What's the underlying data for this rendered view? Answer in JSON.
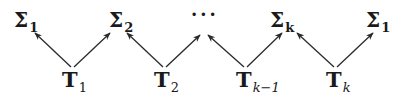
{
  "diagram": {
    "type": "zigzag-arrow-diagram",
    "top_nodes": [
      {
        "id": "sigma1_left",
        "symbol": "Σ",
        "subscript": "1",
        "x": 14,
        "y": 10
      },
      {
        "id": "sigma2",
        "symbol": "Σ",
        "subscript": "2",
        "x": 109,
        "y": 10
      },
      {
        "id": "ellipsis",
        "symbol": "···",
        "subscript": "",
        "x": 191,
        "y": 5
      },
      {
        "id": "sigmak",
        "symbol": "Σ",
        "subscript": "k",
        "x": 270,
        "y": 10
      },
      {
        "id": "sigma1_right",
        "symbol": "Σ",
        "subscript": "1",
        "x": 366,
        "y": 10
      }
    ],
    "bottom_nodes": [
      {
        "id": "T1",
        "symbol": "T",
        "subscript": "1",
        "x": 62,
        "y": 70
      },
      {
        "id": "T2",
        "symbol": "T",
        "subscript": "2",
        "x": 154,
        "y": 70
      },
      {
        "id": "Tk_minus_1",
        "symbol": "T",
        "subscript": "k−1",
        "x": 236,
        "y": 70
      },
      {
        "id": "Tk",
        "symbol": "T",
        "subscript": "k",
        "x": 326,
        "y": 70
      }
    ],
    "edges": [
      {
        "from": "T1",
        "to": "sigma1_left"
      },
      {
        "from": "T1",
        "to": "sigma2"
      },
      {
        "from": "T2",
        "to": "sigma2"
      },
      {
        "from": "T2",
        "to": "ellipsis"
      },
      {
        "from": "Tk_minus_1",
        "to": "ellipsis"
      },
      {
        "from": "Tk_minus_1",
        "to": "sigmak"
      },
      {
        "from": "Tk",
        "to": "sigmak"
      },
      {
        "from": "Tk",
        "to": "sigma1_right"
      }
    ],
    "line_color": "#2a2a2a",
    "text_color": "#1a1a1a"
  },
  "labels": {
    "sigma1_left": {
      "main": "Σ",
      "sub": "1"
    },
    "sigma2": {
      "main": "Σ",
      "sub": "2"
    },
    "ellipsis": {
      "main": "···"
    },
    "sigmak": {
      "main": "Σ",
      "sub": "k"
    },
    "sigma1_right": {
      "main": "Σ",
      "sub": "1"
    },
    "T1": {
      "main": "T",
      "sub": "1"
    },
    "T2": {
      "main": "T",
      "sub": "2"
    },
    "Tk_minus_1": {
      "main": "T",
      "sub": "k−1"
    },
    "Tk": {
      "main": "T",
      "sub": "k"
    }
  }
}
